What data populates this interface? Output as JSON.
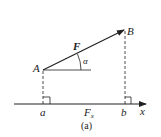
{
  "figure": {
    "caption": "(a)",
    "labels": {
      "point_A": "A",
      "point_B": "B",
      "force": "F",
      "angle": "α",
      "proj_a": "a",
      "proj_b": "b",
      "projection_main": "F",
      "projection_sub": "x",
      "axis": "x"
    },
    "colors": {
      "stroke": "#222222",
      "background": "#ffffff"
    }
  }
}
